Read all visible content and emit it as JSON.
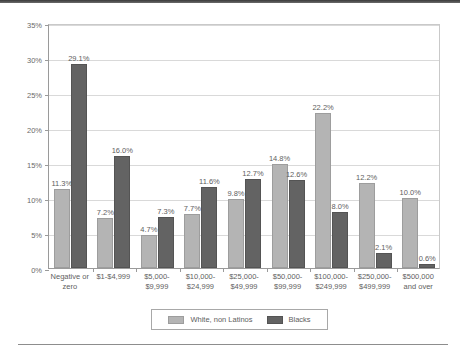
{
  "chart_data": {
    "type": "bar",
    "title": "",
    "xlabel": "",
    "ylabel": "",
    "ylim": [
      0,
      35
    ],
    "ytick_labels": [
      "0%",
      "5%",
      "10%",
      "15%",
      "20%",
      "25%",
      "30%",
      "35%"
    ],
    "ytick_values": [
      0,
      5,
      10,
      15,
      20,
      25,
      30,
      35
    ],
    "grid": true,
    "legend_position": "bottom",
    "categories": [
      "Negative or zero",
      "$1-$4,999",
      "$5,000-$9,999",
      "$10,000-$24,999",
      "$25,000-$49,999",
      "$50,000-$99,999",
      "$100,000-$249,999",
      "$250,000-$499,999",
      "$500,000 and over"
    ],
    "category_lines": [
      [
        "Negative or",
        "zero"
      ],
      [
        "$1-$4,999"
      ],
      [
        "$5,000-",
        "$9,999"
      ],
      [
        "$10,000-",
        "$24,999"
      ],
      [
        "$25,000-",
        "$49,999"
      ],
      [
        "$50,000-",
        "$99,999"
      ],
      [
        "$100,000-",
        "$249,999"
      ],
      [
        "$250,000-",
        "$499,999"
      ],
      [
        "$500,000",
        "and over"
      ]
    ],
    "series": [
      {
        "name": "White, non Latinos",
        "color": "#b4b4b4",
        "values": [
          11.3,
          7.2,
          4.7,
          7.7,
          9.8,
          14.8,
          22.2,
          12.2,
          10.0
        ],
        "labels": [
          "11.3%",
          "7.2%",
          "4.7%",
          "7.7%",
          "9.8%",
          "14.8%",
          "22.2%",
          "12.2%",
          "10.0%"
        ]
      },
      {
        "name": "Blacks",
        "color": "#636363",
        "values": [
          29.1,
          16.0,
          7.3,
          11.6,
          12.7,
          12.6,
          8.0,
          2.1,
          0.6
        ],
        "labels": [
          "29.1%",
          "16.0%",
          "7.3%",
          "11.6%",
          "12.7%",
          "12.6%",
          "8.0%",
          "2.1%",
          "0.6%"
        ]
      }
    ]
  },
  "legend": {
    "items": [
      {
        "label": "White, non Latinos",
        "swatch": "legend-swatch-white-non-latinos"
      },
      {
        "label": "Blacks",
        "swatch": "legend-swatch-blacks"
      }
    ]
  }
}
